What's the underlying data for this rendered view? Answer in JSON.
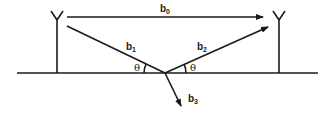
{
  "diagram": {
    "antennas": [
      {
        "id": "transmitter",
        "position": "left"
      },
      {
        "id": "receiver",
        "position": "right"
      }
    ],
    "paths": {
      "b0": {
        "base": "b",
        "sub": "0",
        "kind": "direct path arrow"
      },
      "b1": {
        "base": "b",
        "sub": "1",
        "kind": "incident path"
      },
      "b2": {
        "base": "b",
        "sub": "2",
        "kind": "reflected path arrow"
      },
      "b3": {
        "base": "b",
        "sub": "3",
        "kind": "transmitted/refracted path arrow"
      }
    },
    "angles": {
      "incident": "θ",
      "reflected": "θ"
    },
    "colors": {
      "line": "#1a1a1a",
      "background": "#ffffff"
    }
  }
}
